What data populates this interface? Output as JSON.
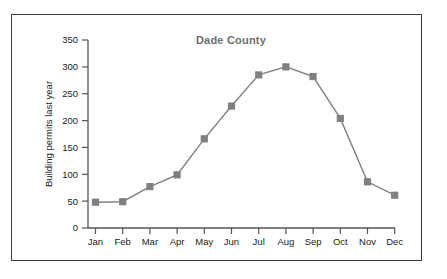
{
  "chart_data": {
    "type": "line",
    "title": "Dade County",
    "xlabel": "",
    "ylabel": "Building permits last year",
    "categories": [
      "Jan",
      "Feb",
      "Mar",
      "Apr",
      "May",
      "Jun",
      "Jul",
      "Aug",
      "Sep",
      "Oct",
      "Nov",
      "Dec"
    ],
    "values": [
      48,
      49,
      77,
      99,
      166,
      227,
      285,
      300,
      282,
      204,
      86,
      61
    ],
    "series": [
      {
        "name": "Building permits last year",
        "values": [
          48,
          49,
          77,
          99,
          166,
          227,
          285,
          300,
          282,
          204,
          86,
          61
        ]
      }
    ],
    "ylim": [
      0,
      350
    ],
    "yticks": [
      0,
      50,
      100,
      150,
      200,
      250,
      300,
      350
    ],
    "ytick_labels": [
      "0",
      "50",
      "100",
      "150",
      "200",
      "250",
      "300",
      "350"
    ],
    "xticks": [
      "Jan",
      "Feb",
      "Mar",
      "Apr",
      "May",
      "Jun",
      "Jul",
      "Aug",
      "Sep",
      "Oct",
      "Nov",
      "Dec"
    ],
    "grid": false,
    "legend": null,
    "legend_position": "none",
    "marker": "square",
    "colors": {
      "line": "#808080",
      "marker": "#808080",
      "axis": "#555555",
      "title": "#6e6e6e",
      "tick_text": "#1a1a1a",
      "frame": "#3c3c3c",
      "background": "#ffffff"
    }
  }
}
